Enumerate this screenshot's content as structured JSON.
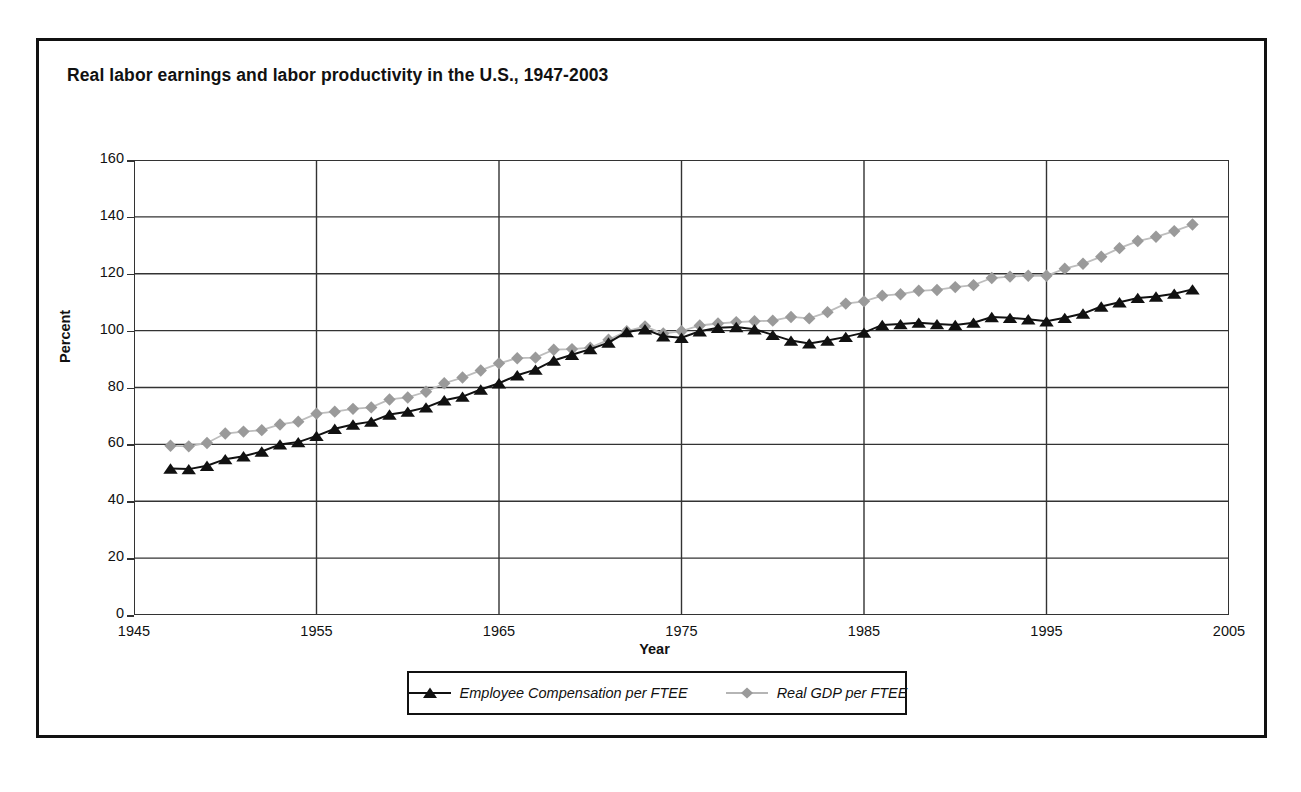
{
  "figure": {
    "title": "Real labor earnings and labor productivity in the U.S.,  1947-2003"
  },
  "chart_data": {
    "type": "line",
    "title": "Real labor earnings and labor productivity in the U.S.,  1947-2003",
    "xlabel": "Year",
    "ylabel": "Percent",
    "xlim": [
      1945,
      2005
    ],
    "ylim": [
      0,
      160
    ],
    "xticks": [
      1945,
      1955,
      1965,
      1975,
      1985,
      1995,
      2005
    ],
    "yticks": [
      0,
      20,
      40,
      60,
      80,
      100,
      120,
      140,
      160
    ],
    "grid": "horizontal-and-vertical-major",
    "legend_position": "below-axes",
    "x": [
      1947,
      1948,
      1949,
      1950,
      1951,
      1952,
      1953,
      1954,
      1955,
      1956,
      1957,
      1958,
      1959,
      1960,
      1961,
      1962,
      1963,
      1964,
      1965,
      1966,
      1967,
      1968,
      1969,
      1970,
      1971,
      1972,
      1973,
      1974,
      1975,
      1976,
      1977,
      1978,
      1979,
      1980,
      1981,
      1982,
      1983,
      1984,
      1985,
      1986,
      1987,
      1988,
      1989,
      1990,
      1991,
      1992,
      1993,
      1994,
      1995,
      1996,
      1997,
      1998,
      1999,
      2000,
      2001,
      2002,
      2003
    ],
    "series": [
      {
        "name": "Employee Compensation per FTEE",
        "marker": "triangle",
        "color": "#111111",
        "values": [
          51.5,
          51.3,
          52.5,
          54.8,
          55.8,
          57.5,
          60.0,
          60.8,
          63.0,
          65.5,
          67.0,
          68.0,
          70.5,
          71.5,
          73.0,
          75.5,
          76.8,
          79.3,
          81.5,
          84.3,
          86.3,
          89.5,
          91.5,
          93.5,
          95.8,
          99.5,
          100.5,
          98.0,
          97.5,
          99.8,
          101.0,
          101.3,
          100.5,
          98.5,
          96.5,
          95.5,
          96.5,
          97.8,
          99.3,
          102.0,
          102.3,
          102.8,
          102.3,
          102.0,
          102.8,
          104.8,
          104.5,
          104.0,
          103.3,
          104.5,
          106.0,
          108.5,
          110.0,
          111.5,
          112.0,
          113.0,
          114.5
        ]
      },
      {
        "name": "Real GDP per FTEE",
        "marker": "diamond",
        "color": "#9a9a9a",
        "values": [
          59.5,
          59.3,
          60.5,
          63.8,
          64.5,
          65.0,
          67.0,
          68.0,
          70.8,
          71.5,
          72.5,
          73.0,
          75.8,
          76.5,
          78.5,
          81.5,
          83.5,
          86.0,
          88.5,
          90.3,
          90.5,
          93.3,
          93.5,
          94.0,
          96.8,
          99.8,
          101.5,
          99.0,
          99.8,
          101.8,
          102.5,
          103.0,
          103.3,
          103.5,
          104.8,
          104.3,
          106.5,
          109.5,
          110.3,
          112.3,
          112.8,
          114.0,
          114.3,
          115.3,
          116.0,
          118.5,
          119.0,
          119.3,
          119.3,
          121.8,
          123.5,
          126.0,
          129.0,
          131.5,
          133.0,
          135.0,
          137.3
        ]
      }
    ]
  },
  "axis": {
    "y_title": "Percent",
    "x_title": "Year",
    "y_tick_labels": [
      "160",
      "140",
      "120",
      "100",
      "80",
      "60",
      "40",
      "20",
      "0"
    ],
    "x_tick_labels": [
      "1945",
      "1955",
      "1965",
      "1975",
      "1985",
      "1995",
      "2005"
    ]
  },
  "legend": {
    "entries": [
      {
        "label": "Employee Compensation per FTEE",
        "marker": "triangle-marker",
        "color": "#111111"
      },
      {
        "label": "Real GDP per FTEE",
        "marker": "diamond-marker",
        "color": "#9a9a9a"
      }
    ]
  }
}
